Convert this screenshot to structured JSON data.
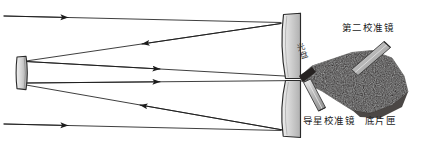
{
  "figure": {
    "background_color": "#ffffff"
  },
  "labels": {
    "second_collimator": "第二校准镜",
    "guide_star_collimator": "导星校准镜",
    "plate_holder": "底片匣",
    "light_disc": "光盘"
  },
  "colors": {
    "ray_line": "#1c1c1c",
    "mirror_fill_light": "#d8d8d8",
    "mirror_fill_mid": "#b9b9b9",
    "mirror_outline": "#2a2a2a",
    "camera_body": "#221f1e",
    "collimator_bar": "#a9a9a9",
    "text": "#1a1a1a"
  },
  "optics": {
    "secondary_mirror": {
      "label": "secondary-mirror",
      "x": 16,
      "y": 56,
      "width": 11,
      "height": 34
    },
    "primary_mirror_upper": {
      "label": "primary-mirror-upper-segment"
    },
    "primary_mirror_lower": {
      "label": "primary-mirror-lower-segment"
    },
    "camera_body": {
      "label": "camera-body"
    },
    "second_collimator_bar": {
      "label": "second-collimator-bar"
    },
    "guide_collimator_bar": {
      "label": "guide-collimator-bar"
    }
  },
  "rays": [
    {
      "name": "incoming-top",
      "direction": "right",
      "from": [
        4,
        16
      ],
      "to": [
        281,
        22
      ]
    },
    {
      "name": "reflected-upper",
      "direction": "left",
      "from": [
        281,
        22
      ],
      "to": [
        26,
        61
      ]
    },
    {
      "name": "outgoing-upper",
      "direction": "right",
      "from": [
        26,
        61
      ],
      "to": [
        300,
        77
      ]
    },
    {
      "name": "outgoing-lower",
      "direction": "right",
      "from": [
        26,
        82
      ],
      "to": [
        300,
        80
      ]
    },
    {
      "name": "reflected-lower",
      "direction": "left",
      "from": [
        283,
        130
      ],
      "to": [
        26,
        84
      ]
    },
    {
      "name": "incoming-bottom",
      "direction": "right",
      "from": [
        4,
        124
      ],
      "to": [
        281,
        131
      ]
    }
  ]
}
